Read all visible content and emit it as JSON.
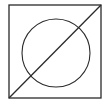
{
  "figure": {
    "stroke_color": "#2a2a2a",
    "background": "#ffffff",
    "square": {
      "x": 9,
      "y": 5,
      "width": 92,
      "height": 93
    },
    "circle": {
      "cx": 56,
      "cy": 53,
      "r": 34
    },
    "diagonal": {
      "x1": 9,
      "y1": 98,
      "x2": 101,
      "y2": 5
    }
  }
}
